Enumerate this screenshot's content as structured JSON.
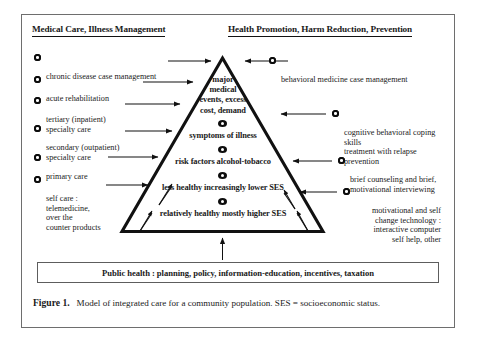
{
  "figure": {
    "headings": {
      "left": "Medical Care, Illness Management",
      "right": "Health Promotion, Harm Reduction, Prevention"
    },
    "left_items": [
      {
        "label": "chronic disease case management"
      },
      {
        "label": "acute rehabilitation"
      },
      {
        "label": "tertiary (inpatient)\nspecialty care"
      },
      {
        "label": "secondary (outpatient)\nspecialty care"
      },
      {
        "label": "primary care"
      },
      {
        "label": "self care :\ntelemedicine,\nover the\ncounter products"
      }
    ],
    "right_items": [
      {
        "label": "behavioral medicine case management"
      },
      {
        "label": "cognitive behavioral coping skills\ntreatment with relapse prevention"
      },
      {
        "label": "brief counseling and brief,\nmotivational interviewing"
      },
      {
        "label": "motivational and self\nchange technology :\ninteractive computer\nself help, other"
      }
    ],
    "pyramid": {
      "levels": [
        {
          "text": "major\nmedical\nevents, excess\ncost, demand"
        },
        {
          "text": "symptoms of illness"
        },
        {
          "text": "risk factors alcohol-tobacco"
        },
        {
          "text": "less healthy increasingly lower SES"
        },
        {
          "text": "relatively healthy mostly higher SES"
        }
      ]
    },
    "public_health_bar": "Public health : planning, policy, information-education, incentives, taxation",
    "caption": {
      "number": "Figure 1.",
      "text": "Model of integrated care for a community population. SES = socioeconomic status."
    },
    "colors": {
      "ink": "#111111",
      "frame": "#6e6e6e",
      "page": "#ffffff"
    }
  }
}
